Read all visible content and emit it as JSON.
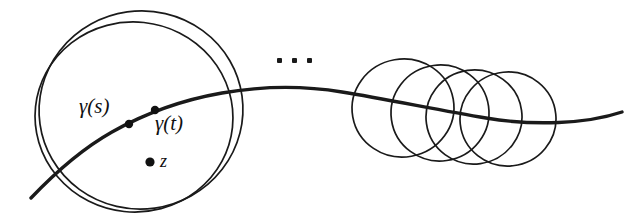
{
  "figure": {
    "background_color": "#ffffff",
    "ink_color": "#1a1a1a",
    "width": 642,
    "height": 223,
    "labels": {
      "gamma_s": "γ(s)",
      "gamma_t": "γ(t)",
      "z": "z",
      "ellipsis": "…"
    },
    "points": [
      {
        "name": "gamma-s-point",
        "x": 129,
        "y": 124,
        "radius": 4.2,
        "label": "γ(s)"
      },
      {
        "name": "gamma-t-point",
        "x": 155,
        "y": 110,
        "radius": 4.2,
        "label": "γ(t)"
      },
      {
        "name": "z-point",
        "x": 150,
        "y": 162,
        "radius": 4.6,
        "label": "z"
      }
    ],
    "curve": {
      "name": "gamma-curve",
      "stroke_width": 3.4,
      "path": "M 31,198 C 52,176 80,150 112,132 C 144,114 182,100 222,93 C 262,86 300,85 342,92 C 386,99 438,110 486,118 C 534,126 586,124 622,112"
    },
    "left_disks": [
      {
        "name": "left-disk-outer",
        "cx": 141,
        "cy": 110,
        "rx": 102,
        "ry": 99,
        "rotation": -8
      },
      {
        "name": "left-disk-inner",
        "cx": 134,
        "cy": 117,
        "rx": 99,
        "ry": 95,
        "rotation": 6
      }
    ],
    "chain_disks": [
      {
        "name": "chain-disk-1",
        "cx": 403,
        "cy": 108,
        "rx": 51,
        "ry": 49,
        "rotation": -10
      },
      {
        "name": "chain-disk-2",
        "cx": 440,
        "cy": 113,
        "rx": 49,
        "ry": 48,
        "rotation": -8
      },
      {
        "name": "chain-disk-3",
        "cx": 474,
        "cy": 117,
        "rx": 48,
        "ry": 47,
        "rotation": -8
      },
      {
        "name": "chain-disk-4",
        "cx": 508,
        "cy": 119,
        "rx": 48,
        "ry": 47,
        "rotation": -6
      }
    ],
    "stroke_widths": {
      "disk": 1.7,
      "curve": 3.4
    }
  }
}
